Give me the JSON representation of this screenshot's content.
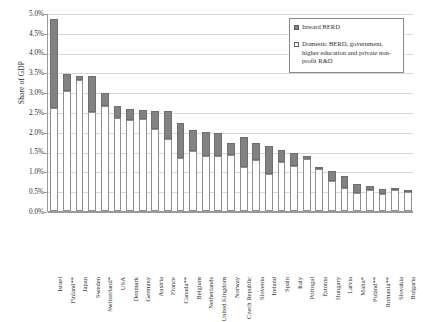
{
  "chart_data": {
    "type": "bar",
    "stacked": true,
    "title": "",
    "xlabel": "",
    "ylabel": "Share of GDP",
    "ylim": [
      0.0,
      5.0
    ],
    "ytick_labels": [
      "0.0%",
      "0.5%",
      "1.0%",
      "1.5%",
      "2.0%",
      "2.5%",
      "3.0%",
      "3.5%",
      "4.0%",
      "4.5%",
      "5.0%"
    ],
    "ytick_values": [
      0.0,
      0.5,
      1.0,
      1.5,
      2.0,
      2.5,
      3.0,
      3.5,
      4.0,
      4.5,
      5.0
    ],
    "grid": true,
    "legend_position": "top-right",
    "categories": [
      "Israel",
      "Finland**",
      "Japan",
      "Sweden",
      "Switzerland*",
      "USA",
      "Denmark",
      "Germany",
      "Austria",
      "France",
      "Canada**",
      "Belgium",
      "Netherlands",
      "United Kingdom",
      "Norway",
      "Czech Republic",
      "Slovenia",
      "Ireland",
      "Spain",
      "Italy",
      "Portugal",
      "Estonia",
      "Hungary",
      "Latvia",
      "Malta*",
      "Poland**",
      "Romania**",
      "Slovakia",
      "Bulgaria"
    ],
    "series": [
      {
        "name": "Domestic BERD, government, higher education and private non-profit R&D",
        "color": "#ffffff",
        "values": [
          2.6,
          3.02,
          3.32,
          2.49,
          2.65,
          2.36,
          2.31,
          2.32,
          2.07,
          1.83,
          1.33,
          1.52,
          1.4,
          1.38,
          1.42,
          1.12,
          1.3,
          0.93,
          1.24,
          1.13,
          1.32,
          1.05,
          0.77,
          0.57,
          0.45,
          0.54,
          0.44,
          0.52,
          0.49
        ]
      },
      {
        "name": "Inward BERD",
        "color": "#828282",
        "values": [
          2.25,
          0.45,
          0.1,
          0.92,
          0.33,
          0.3,
          0.26,
          0.22,
          0.45,
          0.7,
          0.89,
          0.52,
          0.59,
          0.58,
          0.29,
          0.74,
          0.41,
          0.72,
          0.31,
          0.33,
          0.07,
          0.03,
          0.25,
          0.31,
          0.22,
          0.08,
          0.12,
          0.04,
          0.01
        ]
      }
    ]
  },
  "legend": {
    "items": [
      {
        "label": "Inward BERD",
        "swatch": "filled-gray"
      },
      {
        "label": "Domestic BERD, government, higher education and private non-profit R&D",
        "swatch": "empty-white"
      }
    ]
  }
}
